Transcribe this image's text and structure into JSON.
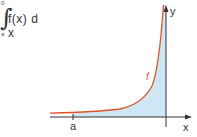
{
  "formula": {
    "upper_limit": "0",
    "lower_limit": "a",
    "integral_sign": "∫",
    "integrand": "f(x) d x"
  },
  "graph": {
    "x_axis_label": "x",
    "y_axis_label": "y",
    "curve_label": "f",
    "tick_label_a": "a",
    "colors": {
      "curve": "#e0542a",
      "fill": "#cfe7f5",
      "axis": "#333333"
    }
  }
}
